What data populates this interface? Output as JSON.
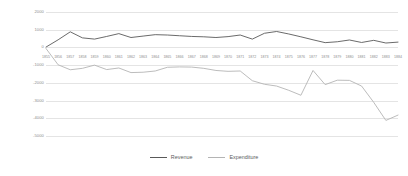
{
  "chart_data": {
    "type": "line",
    "title": "",
    "xlabel": "",
    "ylabel": "",
    "ylim": [
      -5000,
      2000
    ],
    "yticks": [
      2000,
      1000,
      0,
      -1000,
      -2000,
      -3000,
      -4000,
      -5000
    ],
    "ytick_labels": [
      "2000",
      "1000",
      "0",
      "-1000",
      "-2000",
      "-3000",
      "-4000",
      "-5000"
    ],
    "grid": true,
    "legend_position": "bottom-center",
    "categories": [
      "1855",
      "1856",
      "1857",
      "1858",
      "1859",
      "1860",
      "1861",
      "1862",
      "1863",
      "1864",
      "1865",
      "1866",
      "1867",
      "1868",
      "1869",
      "1870",
      "1871",
      "1872",
      "1873",
      "1874",
      "1875",
      "1876",
      "1877",
      "1878",
      "1879",
      "1880",
      "1881",
      "1882",
      "1883",
      "1884"
    ],
    "series": [
      {
        "name": "Revenue",
        "color": "#595959",
        "values": [
          20,
          430,
          880,
          540,
          470,
          620,
          780,
          560,
          640,
          720,
          700,
          660,
          620,
          600,
          560,
          610,
          700,
          470,
          800,
          900,
          760,
          600,
          430,
          270,
          320,
          420,
          280,
          400,
          250,
          300
        ]
      },
      {
        "name": "Expenditure",
        "color": "#b4b4b4",
        "values": [
          -60,
          -980,
          -1260,
          -1180,
          -1000,
          -1250,
          -1160,
          -1420,
          -1400,
          -1330,
          -1120,
          -1100,
          -1110,
          -1180,
          -1300,
          -1350,
          -1330,
          -1880,
          -2080,
          -2180,
          -2420,
          -2700,
          -1300,
          -2100,
          -1850,
          -1860,
          -2180,
          -3100,
          -4120,
          -3820
        ]
      }
    ]
  },
  "legend": {
    "items": [
      {
        "label": "Revenue",
        "color": "#595959"
      },
      {
        "label": "Expenditure",
        "color": "#b4b4b4"
      }
    ]
  }
}
